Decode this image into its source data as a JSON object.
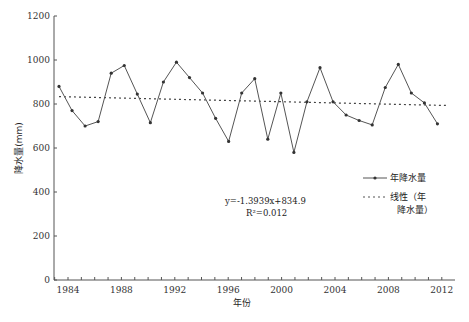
{
  "chart_data": {
    "type": "line",
    "title": "",
    "xlabel": "年份",
    "ylabel": "降水量(mm)",
    "ylim": [
      0,
      1200
    ],
    "yticks": [
      0,
      200,
      400,
      600,
      800,
      1000,
      1200
    ],
    "xticks": [
      1984,
      1988,
      1992,
      1996,
      2000,
      2004,
      2008,
      2012
    ],
    "grid": false,
    "legend_position": "right-middle",
    "x": [
      1983,
      1984,
      1985,
      1986,
      1987,
      1988,
      1989,
      1990,
      1991,
      1992,
      1993,
      1994,
      1995,
      1996,
      1997,
      1998,
      1999,
      2000,
      2001,
      2002,
      2003,
      2004,
      2005,
      2006,
      2007,
      2008,
      2009,
      2010,
      2011,
      2012
    ],
    "series": [
      {
        "name": "年降水量",
        "style": "solid-with-markers",
        "values": [
          880,
          770,
          700,
          720,
          940,
          975,
          845,
          715,
          900,
          990,
          920,
          850,
          735,
          630,
          850,
          915,
          640,
          850,
          580,
          810,
          965,
          810,
          750,
          725,
          705,
          875,
          980,
          850,
          805,
          710
        ]
      },
      {
        "name": "线性（年降水量）",
        "style": "dotted",
        "trend": {
          "slope": -1.3939,
          "intercept": 834.9
        }
      }
    ],
    "annotations": {
      "equation": "y=-1.3939x+834.9",
      "r2": "R²=0.012"
    }
  },
  "legend": {
    "series1": "年降水量",
    "series2_line1": "线性（年",
    "series2_line2": "降水量）"
  },
  "colors": {
    "line": "#555555",
    "marker": "#333333",
    "axis": "#555555"
  }
}
